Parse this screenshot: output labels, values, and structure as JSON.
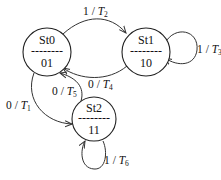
{
  "diagram": {
    "type": "state-machine",
    "states": [
      {
        "id": "St0",
        "name": "St0",
        "output": "01"
      },
      {
        "id": "St1",
        "name": "St1",
        "output": "10"
      },
      {
        "id": "St2",
        "name": "St2",
        "output": "11"
      }
    ],
    "transitions": [
      {
        "from": "St0",
        "to": "St1",
        "input": "1",
        "sep": " / ",
        "var": "T",
        "sub": "2"
      },
      {
        "from": "St1",
        "to": "St0",
        "input": "0",
        "sep": " / ",
        "var": "T",
        "sub": "4"
      },
      {
        "from": "St1",
        "to": "St1",
        "input": "1",
        "sep": " / ",
        "var": "T",
        "sub": "3"
      },
      {
        "from": "St2",
        "to": "St0",
        "input": "0",
        "sep": " / ",
        "var": "T",
        "sub": "5"
      },
      {
        "from": "St0",
        "to": "St2",
        "input": "0",
        "sep": " / ",
        "var": "T",
        "sub": "1"
      },
      {
        "from": "St2",
        "to": "St2",
        "input": "1",
        "sep": " / ",
        "var": "T",
        "sub": "6"
      }
    ],
    "divider": "--------"
  }
}
